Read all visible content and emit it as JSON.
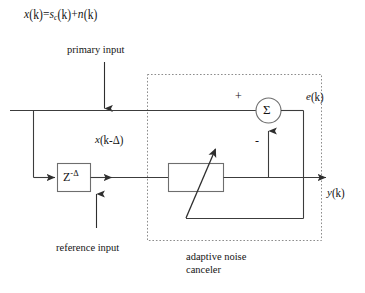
{
  "figure": {
    "type": "block-diagram",
    "background_color": "#ffffff",
    "line_color": "#3c3c3c",
    "text_color": "#141414"
  },
  "equation": {
    "lhs_var": "x",
    "lhs_arg": "(k)",
    "equals": "=",
    "term1_var": "s",
    "term1_sub": "c",
    "term1_arg": "(k)",
    "plus": "+",
    "term2_var": "n",
    "term2_arg": "(k)",
    "full_text": "x(k) = s_c(k) + n(k)"
  },
  "labels": {
    "primary_input": "primary input",
    "reference_input": "reference input",
    "delayed_signal_var": "x",
    "delayed_signal_arg": "(k-Δ)",
    "error_var": "e",
    "error_arg": "(k)",
    "output_var": "y",
    "output_arg": "(k)",
    "plus_sign": "+",
    "minus_sign": "-",
    "summation_symbol": "Σ",
    "delay_base": "Z",
    "delay_exponent": "-Δ",
    "canceler_caption_line1": "adaptive noise",
    "canceler_caption_line2": "canceler"
  },
  "blocks": [
    {
      "name": "delay-block",
      "label": "Z^-Δ",
      "description": "delay element Z to the minus Delta"
    },
    {
      "name": "adaptive-filter-block",
      "label": "",
      "description": "adjustable adaptive filter with diagonal tuning arrow"
    },
    {
      "name": "summing-junction",
      "label": "Σ",
      "description": "summing junction with plus and minus inputs"
    },
    {
      "name": "canceler-boundary",
      "label": "adaptive noise canceler",
      "description": "dashed boundary enclosing the adaptive noise canceler"
    }
  ],
  "signals": [
    {
      "name": "primary-input-signal",
      "label": "primary input"
    },
    {
      "name": "reference-input-signal",
      "label": "reference input"
    },
    {
      "name": "delayed-input-signal",
      "label": "x(k-Δ)"
    },
    {
      "name": "error-signal",
      "label": "e(k)"
    },
    {
      "name": "output-signal",
      "label": "y(k)"
    }
  ]
}
